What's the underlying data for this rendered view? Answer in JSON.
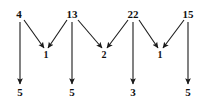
{
  "diagram": {
    "background_color": "#ffffff",
    "stroke_color": "#1a1a1a",
    "text_color": "#111111",
    "width": 201,
    "height": 102,
    "rows": {
      "top": {
        "y": 14,
        "labels": [
          "4",
          "13",
          "22",
          "15"
        ]
      },
      "middle": {
        "y": 55,
        "labels": [
          "1",
          "2",
          "1"
        ]
      },
      "bottom": {
        "y": 92,
        "labels": [
          "5",
          "5",
          "3",
          "5"
        ]
      }
    },
    "top_nodes": [
      {
        "id": "top-0",
        "value": "4",
        "x": 19,
        "y": 14
      },
      {
        "id": "top-1",
        "value": "13",
        "x": 72,
        "y": 14
      },
      {
        "id": "top-2",
        "value": "22",
        "x": 133,
        "y": 14
      },
      {
        "id": "top-3",
        "value": "15",
        "x": 188,
        "y": 14
      }
    ],
    "middle_nodes": [
      {
        "id": "mid-0",
        "value": "1",
        "x": 46,
        "y": 55
      },
      {
        "id": "mid-1",
        "value": "2",
        "x": 104,
        "y": 55
      },
      {
        "id": "mid-2",
        "value": "1",
        "x": 160,
        "y": 55
      }
    ],
    "bottom_nodes": [
      {
        "id": "bot-0",
        "value": "5",
        "x": 20,
        "y": 92
      },
      {
        "id": "bot-1",
        "value": "5",
        "x": 72,
        "y": 92
      },
      {
        "id": "bot-2",
        "value": "3",
        "x": 133,
        "y": 92
      },
      {
        "id": "bot-3",
        "value": "5",
        "x": 188,
        "y": 92
      }
    ],
    "vertical_edges": [
      {
        "id": "v-0",
        "from": "top-0",
        "to": "bot-0",
        "x1": 20,
        "y1": 22,
        "x2": 20,
        "y2": 84
      },
      {
        "id": "v-1",
        "from": "top-1",
        "to": "bot-1",
        "x1": 72,
        "y1": 22,
        "x2": 72,
        "y2": 84
      },
      {
        "id": "v-2",
        "from": "top-2",
        "to": "bot-2",
        "x1": 133,
        "y1": 22,
        "x2": 133,
        "y2": 84
      },
      {
        "id": "v-3",
        "from": "top-3",
        "to": "bot-3",
        "x1": 188,
        "y1": 22,
        "x2": 188,
        "y2": 84
      }
    ],
    "diagonal_edges": [
      {
        "id": "d-0",
        "from": "top-0",
        "to": "mid-0",
        "x1": 24,
        "y1": 20,
        "x2": 44,
        "y2": 48
      },
      {
        "id": "d-1",
        "from": "top-1",
        "to": "mid-0",
        "x1": 67,
        "y1": 20,
        "x2": 48,
        "y2": 48
      },
      {
        "id": "d-2",
        "from": "top-1",
        "to": "mid-1",
        "x1": 78,
        "y1": 20,
        "x2": 102,
        "y2": 48
      },
      {
        "id": "d-3",
        "from": "top-2",
        "to": "mid-1",
        "x1": 128,
        "y1": 20,
        "x2": 107,
        "y2": 48
      },
      {
        "id": "d-4",
        "from": "top-2",
        "to": "mid-2",
        "x1": 139,
        "y1": 20,
        "x2": 158,
        "y2": 48
      },
      {
        "id": "d-5",
        "from": "top-3",
        "to": "mid-2",
        "x1": 184,
        "y1": 20,
        "x2": 163,
        "y2": 48
      }
    ]
  }
}
